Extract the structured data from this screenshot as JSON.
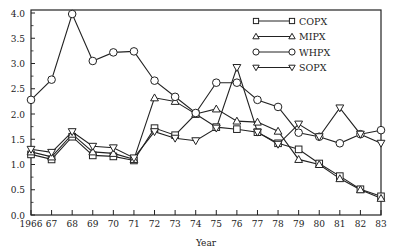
{
  "chart_data": {
    "type": "line",
    "title": "",
    "xlabel": "Year",
    "ylabel": "",
    "ylim": [
      0,
      4.0
    ],
    "yticks": [
      "0.0",
      "0.5",
      "1.0",
      "1.5",
      "2.0",
      "2.5",
      "3.0",
      "3.5",
      "4.0"
    ],
    "categories": [
      "1966",
      "67",
      "68",
      "69",
      "70",
      "71",
      "72",
      "73",
      "74",
      "75",
      "76",
      "77",
      "78",
      "79",
      "80",
      "81",
      "82",
      "83"
    ],
    "grid": false,
    "legend_position": "upper right",
    "series": [
      {
        "name": "COPX",
        "marker": "square",
        "values": [
          1.2,
          1.1,
          1.55,
          1.18,
          1.16,
          1.08,
          1.72,
          1.58,
          2.0,
          1.74,
          1.7,
          1.64,
          1.42,
          1.3,
          1.02,
          0.77,
          0.51,
          0.37
        ]
      },
      {
        "name": "MIPX",
        "marker": "triangle-up",
        "values": [
          1.25,
          1.15,
          1.6,
          1.25,
          1.22,
          1.1,
          2.32,
          2.25,
          2.0,
          2.1,
          1.86,
          1.84,
          1.66,
          1.1,
          1.0,
          0.72,
          0.5,
          0.33
        ]
      },
      {
        "name": "WHPX",
        "marker": "circle",
        "values": [
          2.28,
          2.68,
          3.98,
          3.05,
          3.22,
          3.24,
          2.66,
          2.34,
          2.02,
          2.62,
          2.62,
          2.28,
          2.14,
          1.63,
          1.55,
          1.42,
          1.6,
          1.68
        ]
      },
      {
        "name": "SOPX",
        "marker": "triangle-down",
        "values": [
          1.3,
          1.24,
          1.65,
          1.36,
          1.33,
          1.13,
          1.65,
          1.52,
          1.47,
          1.72,
          2.92,
          1.64,
          1.4,
          1.8,
          1.55,
          2.12,
          1.6,
          1.42
        ]
      }
    ]
  }
}
